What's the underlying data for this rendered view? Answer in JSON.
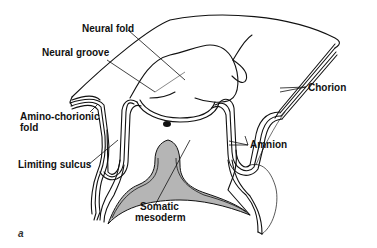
{
  "diagram": {
    "type": "anatomical-cross-section",
    "figure_letter": "a",
    "labels": {
      "neural_fold": "Neural fold",
      "neural_groove": "Neural groove",
      "amino_chorionic_fold_line1": "Amino-chorionic",
      "amino_chorionic_fold_line2": "fold",
      "limiting_sulcus": "Limiting sulcus",
      "somatic_mesoderm_line1": "Somatic",
      "somatic_mesoderm_line2": "mesoderm",
      "chorion": "Chorion",
      "amnion": "Amnion"
    },
    "colors": {
      "line": "#111111",
      "mesoderm_fill": "#b5b5b5",
      "background": "#ffffff"
    }
  }
}
